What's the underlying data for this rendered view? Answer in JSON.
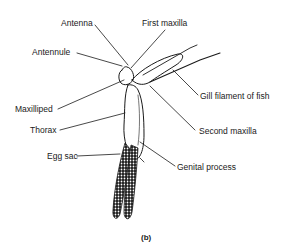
{
  "figure": {
    "caption": "(b)",
    "labels": {
      "antenna": "Antenna",
      "first_maxilla": "First maxilla",
      "antennule": "Antennule",
      "gill_filament": "Gill filament of fish",
      "maxilliped": "Maxilliped",
      "second_maxilla": "Second maxilla",
      "thorax": "Thorax",
      "egg_sac": "Egg sac",
      "genital_process": "Genital process"
    },
    "colors": {
      "ink": "#1a1a1a",
      "background": "#ffffff"
    }
  }
}
